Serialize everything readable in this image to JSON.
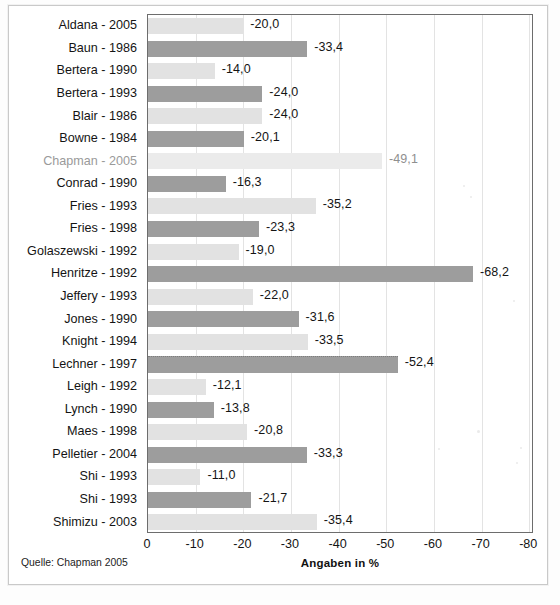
{
  "source_note": "Quelle: Chapman 2005",
  "axis": {
    "title": "Angaben in %",
    "ticks": [
      "0",
      "-10",
      "-20",
      "-30",
      "-40",
      "-50",
      "-60",
      "-70",
      "-80"
    ],
    "min": 0,
    "max": -80
  },
  "chart_data": {
    "type": "bar",
    "orientation": "horizontal",
    "title": "",
    "subtitle": "",
    "xlabel": "Angaben in %",
    "ylabel": "",
    "xlim": [
      0,
      -80
    ],
    "grid": true,
    "legend": "none",
    "value_format": "comma-decimal",
    "colors": {
      "light": "#e2e2e2",
      "dark": "#9d9d9d",
      "faded": "#ebebeb"
    },
    "categories": [
      "Aldana - 2005",
      "Baun - 1986",
      "Bertera - 1990",
      "Bertera - 1993",
      "Blair - 1986",
      "Bowne - 1984",
      "Chapman - 2005",
      "Conrad - 1990",
      "Fries - 1993",
      "Fries - 1998",
      "Golaszewski - 1992",
      "Henritze - 1992",
      "Jeffery - 1993",
      "Jones - 1990",
      "Knight - 1994",
      "Lechner - 1997",
      "Leigh - 1992",
      "Lynch - 1990",
      "Maes - 1998",
      "Pelletier - 2004",
      "Shi - 1993",
      "Shi - 1993",
      "Shimizu - 2003"
    ],
    "values": [
      -20.0,
      -33.4,
      -14.0,
      -24.0,
      -24.0,
      -20.1,
      -49.1,
      -16.3,
      -35.2,
      -23.3,
      -19.0,
      -68.2,
      -22.0,
      -31.6,
      -33.5,
      -52.4,
      -12.1,
      -13.8,
      -20.8,
      -33.3,
      -11.0,
      -21.7,
      -35.4
    ],
    "value_labels": [
      "-20,0",
      "-33,4",
      "-14,0",
      "-24,0",
      "-24,0",
      "-20,1",
      "-49,1",
      "-16,3",
      "-35,2",
      "-23,3",
      "-19,0",
      "-68,2",
      "-22,0",
      "-31,6",
      "-33,5",
      "-52,4",
      "-12,1",
      "-13,8",
      "-20,8",
      "-33,3",
      "-11,0",
      "-21,7",
      "-35,4"
    ],
    "bar_styles": [
      "light",
      "dark",
      "light",
      "dark",
      "light",
      "dark",
      "faded",
      "dark",
      "light",
      "dark",
      "light",
      "dark",
      "light",
      "dark",
      "light",
      "dark",
      "light",
      "dark",
      "light",
      "dark",
      "light",
      "dark",
      "light"
    ],
    "faded_rows": [
      6
    ]
  }
}
